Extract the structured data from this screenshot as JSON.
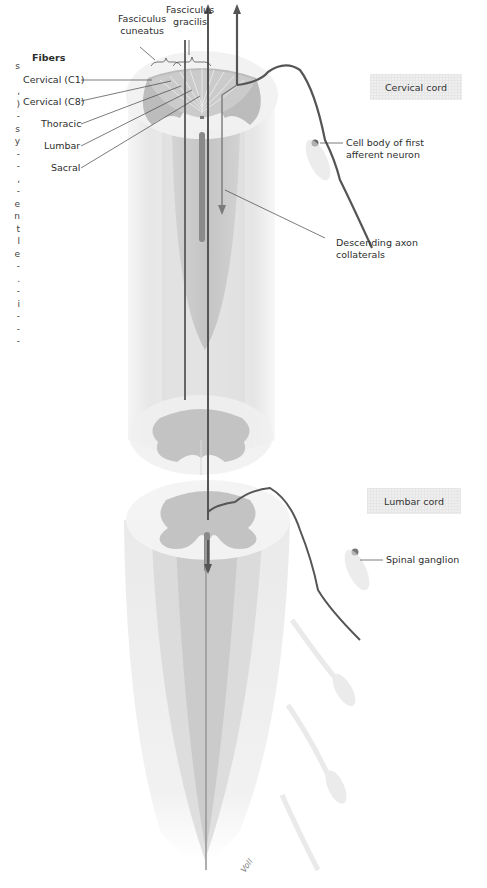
{
  "figure": {
    "labels": {
      "fasciculus_cuneatus": [
        "Fasciculus",
        "cuneatus"
      ],
      "fasciculus_gracilis": [
        "Fasciculus",
        "gracilis"
      ],
      "fibers_heading": "Fibers",
      "fibers": [
        "Cervical (C1)",
        "Cervical (C8)",
        "Thoracic",
        "Lumbar",
        "Sacral"
      ],
      "cell_body": [
        "Cell body of first",
        "afferent neuron"
      ],
      "descending": [
        "Descending axon",
        "collaterals"
      ],
      "spinal_ganglion": "Spinal ganglion",
      "signature": "Voll"
    },
    "region_tags": {
      "cervical": "Cervical cord",
      "lumbar": "Lumbar cord"
    },
    "edge_text_fragments": [
      "s",
      "",
      ",",
      ")",
      "-",
      "s",
      "y",
      "-",
      "-",
      ",",
      "-",
      "e",
      "n",
      "t",
      "l",
      "e",
      "-",
      ".",
      "-",
      "i",
      "-",
      "-",
      "-"
    ],
    "colors": {
      "background": "#ffffff",
      "white_matter": "#e9e9e9",
      "gray_matter": "#bdbdbd",
      "axon": "#555555",
      "tag_bg": "#efefef",
      "label_text": "#2e2e2e"
    }
  }
}
